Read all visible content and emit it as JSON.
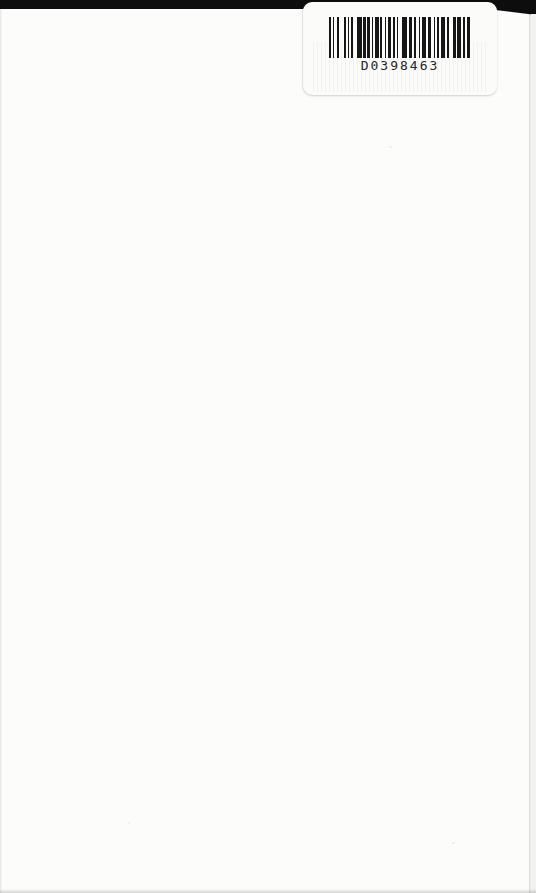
{
  "scene": {
    "description": "Blank white book back cover, photographed/scanned, with a used-book barcode sticker in the top-right corner and black photo background visible along the top edge",
    "page_background_color": "#fcfcfb",
    "top_strip_color": "#0d0d0d",
    "page_edge_color": "#c9c9c5"
  },
  "sticker": {
    "code_text": "D0398463",
    "sticker_color": "#fbfbf9",
    "bar_color": "#161616",
    "barcode_pattern": [
      [
        2,
        2
      ],
      [
        1,
        3
      ],
      [
        2,
        5
      ],
      [
        2,
        2
      ],
      [
        1,
        2
      ],
      [
        2,
        4
      ],
      [
        5,
        1
      ],
      [
        3,
        1
      ],
      [
        3,
        2
      ],
      [
        1,
        2
      ],
      [
        4,
        1
      ],
      [
        2,
        3
      ],
      [
        1,
        2
      ],
      [
        3,
        2
      ],
      [
        2,
        2
      ],
      [
        1,
        4
      ],
      [
        5,
        2
      ],
      [
        3,
        2
      ],
      [
        2,
        3
      ],
      [
        1,
        2
      ],
      [
        4,
        2
      ],
      [
        3,
        3
      ],
      [
        1,
        2
      ],
      [
        2,
        2
      ],
      [
        4,
        2
      ],
      [
        2,
        4
      ],
      [
        3,
        1
      ],
      [
        4,
        2
      ],
      [
        2,
        2
      ],
      [
        3,
        0
      ]
    ]
  }
}
